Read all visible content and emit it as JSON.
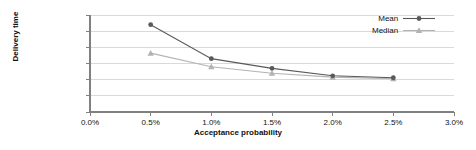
{
  "chart_data": {
    "type": "line",
    "title": "",
    "xlabel": "Acceptance probability",
    "ylabel": "Delivery time",
    "x": [
      0.5,
      1.0,
      1.5,
      2.0,
      2.5
    ],
    "xtick_labels": [
      "0.0%",
      "0.5%",
      "1.0%",
      "1.5%",
      "2.0%",
      "2.5%",
      "3.0%"
    ],
    "xtick_values": [
      0.0,
      0.5,
      1.0,
      1.5,
      2.0,
      2.5,
      3.0
    ],
    "xlim": [
      0.0,
      3.0
    ],
    "ytick_labels": [
      "0 minutes",
      "5 minutes",
      "10 minutes",
      "15 minutes",
      "20 minutes",
      "25 minutes",
      "30 minutes"
    ],
    "ytick_values": [
      0,
      5,
      10,
      15,
      20,
      25,
      30
    ],
    "ylim": [
      0,
      30
    ],
    "grid": "horizontal",
    "legend_position": "top-right",
    "series": [
      {
        "name": "Mean",
        "color": "#595959",
        "marker": "circle",
        "values": [
          27.0,
          16.5,
          13.5,
          11.2,
          10.6
        ]
      },
      {
        "name": "Median",
        "color": "#b3b3b3",
        "marker": "triangle",
        "values": [
          18.2,
          14.0,
          12.0,
          10.8,
          10.3
        ]
      }
    ]
  }
}
